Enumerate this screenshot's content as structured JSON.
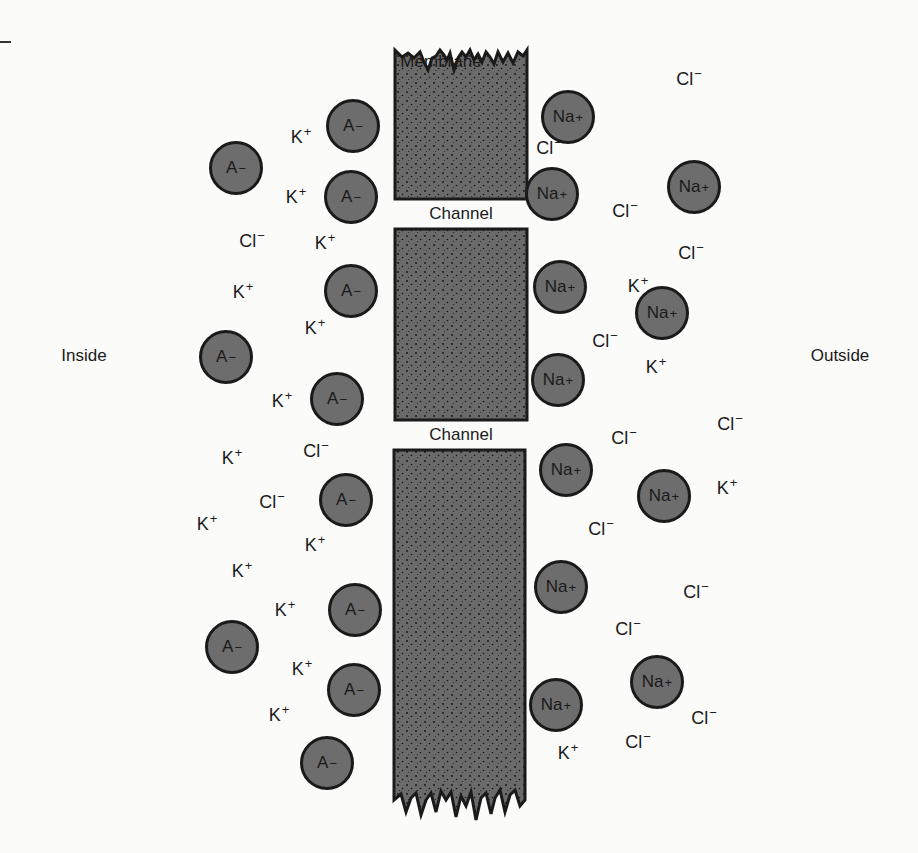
{
  "header": {
    "partial_text": "y                gy"
  },
  "labels": {
    "membrane": "Membrane",
    "channel_1": "Channel",
    "channel_2": "Channel",
    "inside": "Inside",
    "outside": "Outside"
  },
  "colors": {
    "membrane_fill": "#6a6a6a",
    "ion_fill": "#6d6d6d",
    "outline": "#1a1a1a",
    "background": "#fbfbfa"
  },
  "membrane_blocks": [
    {
      "x": 395,
      "top": 50,
      "bottom": 199,
      "width": 132,
      "top_edge": "jagged",
      "bottom_edge": "flat"
    },
    {
      "x": 395,
      "top": 229,
      "bottom": 420,
      "width": 132,
      "top_edge": "flat",
      "bottom_edge": "flat"
    },
    {
      "x": 395,
      "top": 450,
      "bottom": 800,
      "width": 131,
      "top_edge": "flat",
      "bottom_edge": "jagged"
    }
  ],
  "ions": {
    "anions_A": {
      "symbol": "A",
      "charge": "−",
      "positions": [
        [
          353,
          126
        ],
        [
          236,
          168
        ],
        [
          351,
          197
        ],
        [
          351,
          291
        ],
        [
          226,
          357
        ],
        [
          337,
          399
        ],
        [
          346,
          500
        ],
        [
          355,
          610
        ],
        [
          232,
          647
        ],
        [
          354,
          690
        ],
        [
          327,
          763
        ]
      ]
    },
    "sodium": {
      "symbol": "Na",
      "charge": "+",
      "positions": [
        [
          568,
          117
        ],
        [
          552,
          194
        ],
        [
          694,
          187
        ],
        [
          560,
          287
        ],
        [
          662,
          313
        ],
        [
          558,
          380
        ],
        [
          566,
          470
        ],
        [
          664,
          496
        ],
        [
          561,
          587
        ],
        [
          657,
          682
        ],
        [
          556,
          705
        ]
      ]
    },
    "potassium": {
      "symbol": "K",
      "charge": "+",
      "positions": [
        [
          301,
          136
        ],
        [
          296,
          196
        ],
        [
          325,
          242
        ],
        [
          243,
          291
        ],
        [
          315,
          327
        ],
        [
          282,
          400
        ],
        [
          232,
          457
        ],
        [
          207,
          523
        ],
        [
          315,
          544
        ],
        [
          242,
          570
        ],
        [
          285,
          609
        ],
        [
          302,
          668
        ],
        [
          279,
          714
        ],
        [
          568,
          752
        ],
        [
          638,
          285
        ],
        [
          656,
          366
        ],
        [
          727,
          487
        ]
      ]
    },
    "chloride": {
      "symbol": "Cl",
      "charge": "−",
      "positions": [
        [
          689,
          78
        ],
        [
          549,
          147
        ],
        [
          625,
          210
        ],
        [
          252,
          240
        ],
        [
          691,
          252
        ],
        [
          605,
          340
        ],
        [
          316,
          450
        ],
        [
          624,
          437
        ],
        [
          730,
          423
        ],
        [
          272,
          501
        ],
        [
          601,
          528
        ],
        [
          696,
          591
        ],
        [
          628,
          628
        ],
        [
          638,
          741
        ],
        [
          704,
          717
        ]
      ]
    }
  },
  "label_positions": {
    "membrane": [
      441,
      62
    ],
    "channel_1": [
      461,
      214
    ],
    "channel_2": [
      461,
      435
    ],
    "inside": [
      84,
      356
    ],
    "outside": [
      840,
      356
    ]
  }
}
